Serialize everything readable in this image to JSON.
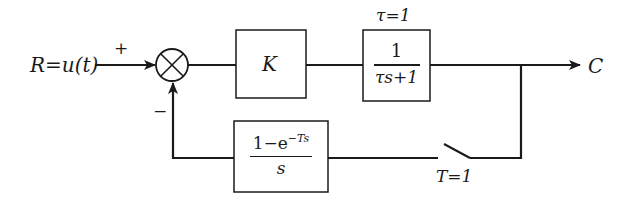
{
  "diagram": {
    "type": "closed-loop sampled-data control system block diagram",
    "input": {
      "label": "R=u(t)"
    },
    "output": {
      "label": "C"
    },
    "summing_junction": {
      "plus_sign": "+",
      "minus_sign": "−"
    },
    "blocks": {
      "gain": {
        "label": "K"
      },
      "plant": {
        "parameter": "τ=1",
        "numerator": "1",
        "denominator": "τs+1"
      },
      "zoh": {
        "numerator_main": "1−e",
        "numerator_exp": "−Ts",
        "denominator": "s"
      }
    },
    "sampler": {
      "label": "T=1"
    }
  },
  "colors": {
    "stroke": "#1a1a1a",
    "background": "#ffffff"
  }
}
